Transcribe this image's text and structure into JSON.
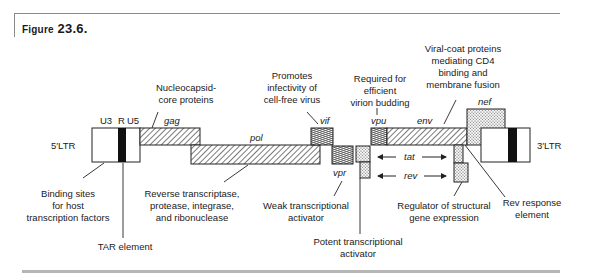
{
  "figure": {
    "title_word": "Figure",
    "title_number": "23.6."
  },
  "ltr": {
    "left_label": "5′LTR",
    "right_label": "3′LTR",
    "segments": [
      "U3",
      "R",
      "U5"
    ]
  },
  "genes": {
    "gag": "gag",
    "pol": "pol",
    "vif": "vif",
    "vpr": "vpr",
    "vpu": "vpu",
    "env": "env",
    "nef": "nef",
    "tat": "tat",
    "rev": "rev"
  },
  "annotations": {
    "gag": [
      "Nucleocapsid-",
      "core proteins"
    ],
    "vif": [
      "Promotes",
      "infectivity of",
      "cell-free virus"
    ],
    "vpu": [
      "Required for",
      "efficient",
      "virion budding"
    ],
    "env": [
      "Viral-coat proteins",
      "mediating CD4",
      "binding and",
      "membrane fusion"
    ],
    "ltr": [
      "Binding sites",
      "for host",
      "transcription factors"
    ],
    "tar": [
      "TAR element"
    ],
    "pol": [
      "Reverse transcriptase,",
      "protease, integrase,",
      "and ribonuclease"
    ],
    "vpr": [
      "Weak transcriptional",
      "activator"
    ],
    "tat": [
      "Potent transcriptional",
      "activator"
    ],
    "rev": [
      "Regulator of structural",
      "gene expression"
    ],
    "rre": [
      "Rev response",
      "element"
    ]
  }
}
